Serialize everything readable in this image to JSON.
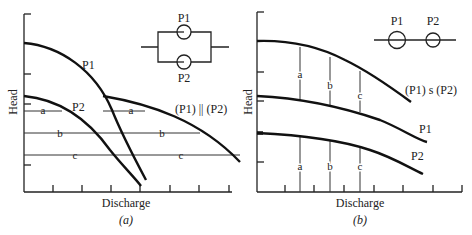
{
  "panel_a": {
    "caption": "(a)",
    "xlabel": "Discharge",
    "ylabel": "Head",
    "curve_labels": {
      "p1": "P1",
      "p2": "P2",
      "combined": "(P1) || (P2)"
    },
    "combined_label_left": "(P1)",
    "combined_label_sym": "||",
    "combined_label_right": "(P2)",
    "levels": [
      "a",
      "b",
      "c"
    ],
    "schematic": {
      "type": "parallel",
      "top_label": "P1",
      "bottom_label": "P2"
    }
  },
  "panel_b": {
    "caption": "(b)",
    "xlabel": "Discharge",
    "ylabel": "Head",
    "curve_labels": {
      "p1": "P1",
      "p2": "P2",
      "combined": "(P1) s (P2)"
    },
    "levels": [
      "a",
      "b",
      "c"
    ],
    "schematic": {
      "type": "series",
      "left_label": "P1",
      "right_label": "P2"
    }
  },
  "caption_a_letter": "a",
  "caption_b_letter": "b"
}
